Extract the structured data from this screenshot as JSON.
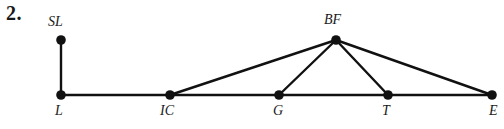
{
  "figure": {
    "problem_number": "2.",
    "background_color": "#ffffff",
    "stroke_color": "#111111",
    "node_fill_color": "#111111",
    "baseline_y": 95,
    "nodes": [
      {
        "id": "SL",
        "label": "SL",
        "x": 61,
        "y": 40,
        "label_x": 48,
        "label_y": 14,
        "label_pos": "above"
      },
      {
        "id": "L",
        "label": "L",
        "x": 61,
        "y": 95,
        "label_x": 55,
        "label_y": 103,
        "label_pos": "below"
      },
      {
        "id": "IC",
        "label": "IC",
        "x": 170,
        "y": 95,
        "label_x": 160,
        "label_y": 103,
        "label_pos": "below"
      },
      {
        "id": "G",
        "label": "G",
        "x": 279,
        "y": 95,
        "label_x": 273,
        "label_y": 103,
        "label_pos": "below"
      },
      {
        "id": "BF",
        "label": "BF",
        "x": 336,
        "y": 40,
        "label_x": 324,
        "label_y": 12,
        "label_pos": "above"
      },
      {
        "id": "T",
        "label": "T",
        "x": 388,
        "y": 95,
        "label_x": 382,
        "label_y": 103,
        "label_pos": "below"
      },
      {
        "id": "E",
        "label": "E",
        "x": 492,
        "y": 95,
        "label_x": 489,
        "label_y": 103,
        "label_pos": "below"
      }
    ],
    "edges": [
      {
        "from": "SL",
        "to": "L"
      },
      {
        "from": "L",
        "to": "IC"
      },
      {
        "from": "IC",
        "to": "G"
      },
      {
        "from": "G",
        "to": "T"
      },
      {
        "from": "T",
        "to": "E"
      },
      {
        "from": "IC",
        "to": "BF"
      },
      {
        "from": "G",
        "to": "BF"
      },
      {
        "from": "BF",
        "to": "T"
      },
      {
        "from": "BF",
        "to": "E"
      }
    ],
    "node_radius": 4.8,
    "edge_width": 2.4
  }
}
